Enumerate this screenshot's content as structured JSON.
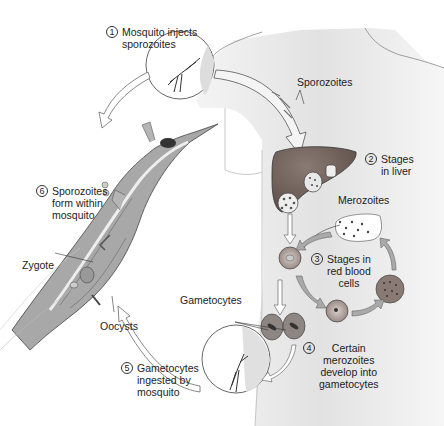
{
  "diagram": {
    "colors": {
      "liver": "#6b5a54",
      "mosquito_body": "#a8a8a8",
      "skin": "#e6e6e6",
      "arrow_fill": "#a9a9a9",
      "outline": "#444444",
      "text": "#222222"
    },
    "steps": [
      {
        "number": "1",
        "text_lines": [
          "Mosquito injects",
          "sporozoites"
        ]
      },
      {
        "number": "2",
        "text_lines": [
          "Stages",
          "in liver"
        ]
      },
      {
        "number": "3",
        "text_lines": [
          "Stages in",
          "red blood",
          "cells"
        ]
      },
      {
        "number": "4",
        "text_lines": [
          "Certain",
          "merozoites",
          "develop into",
          "gametocytes"
        ]
      },
      {
        "number": "5",
        "text_lines": [
          "Gametocytes",
          "ingested by",
          "mosquito"
        ]
      },
      {
        "number": "6",
        "text_lines": [
          "Sporozoites",
          "form within",
          "mosquito"
        ]
      }
    ],
    "labels": {
      "sporozoites": "Sporozoites",
      "merozoites": "Merozoites",
      "gametocytes": "Gametocytes",
      "zygote": "Zygote",
      "oocysts": "Oocysts"
    }
  }
}
